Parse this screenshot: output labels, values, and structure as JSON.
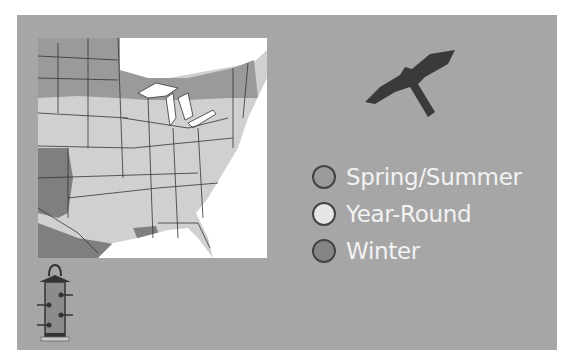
{
  "map": {
    "region": "Eastern United States",
    "colors": {
      "background_panel": "#a6a6a6",
      "water": "#ffffff",
      "spring_summer": "#9a9a9a",
      "year_round": "#d0d0d0",
      "winter": "#7f7f7f",
      "outline": "#333333"
    }
  },
  "icons": {
    "bird": "hawk-silhouette-icon",
    "feeder": "bird-feeder-icon"
  },
  "legend": {
    "items": [
      {
        "label": "Spring/Summer",
        "color": "#9a9a9a"
      },
      {
        "label": "Year-Round",
        "color": "#e6e6e6"
      },
      {
        "label": "Winter",
        "color": "#858585"
      }
    ]
  }
}
